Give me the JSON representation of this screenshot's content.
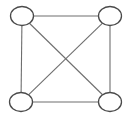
{
  "diagram": {
    "type": "graph",
    "colors": {
      "background": "#ffffff",
      "node_fill": "#ffffff",
      "node_stroke": "#4a4a4a",
      "edge_stroke": "#6e6e6e"
    },
    "nodes": [
      {
        "id": "top-left",
        "label": ""
      },
      {
        "id": "top-right",
        "label": ""
      },
      {
        "id": "bottom-left",
        "label": ""
      },
      {
        "id": "bottom-right",
        "label": ""
      }
    ],
    "edges": [
      {
        "from": "top-left",
        "to": "top-right"
      },
      {
        "from": "bottom-left",
        "to": "bottom-right"
      },
      {
        "from": "top-left",
        "to": "bottom-left"
      },
      {
        "from": "top-right",
        "to": "bottom-right"
      },
      {
        "from": "top-left",
        "to": "bottom-right"
      },
      {
        "from": "top-right",
        "to": "bottom-left"
      }
    ]
  }
}
